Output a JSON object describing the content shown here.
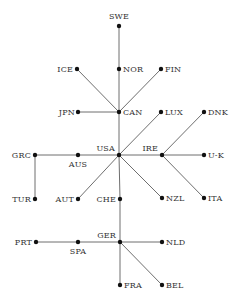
{
  "diagram": {
    "type": "tree",
    "colors": {
      "edge": "#6e6e6e",
      "node": "#111111",
      "label": "#333333",
      "background": "#ffffff"
    },
    "nodes": [
      {
        "id": "SWE",
        "label": "SWE",
        "x": 119,
        "y": 26,
        "lx": 119,
        "ly": 19,
        "anchor": "middle"
      },
      {
        "id": "NOR",
        "label": "NOR",
        "x": 119,
        "y": 69,
        "lx": 123,
        "ly": 72,
        "anchor": "start"
      },
      {
        "id": "ICE",
        "label": "ICE",
        "x": 77,
        "y": 69,
        "lx": 73,
        "ly": 72,
        "anchor": "end"
      },
      {
        "id": "FIN",
        "label": "FIN",
        "x": 161,
        "y": 69,
        "lx": 165,
        "ly": 72,
        "anchor": "start"
      },
      {
        "id": "JPN",
        "label": "JPN",
        "x": 78,
        "y": 112,
        "lx": 75,
        "ly": 115,
        "anchor": "end"
      },
      {
        "id": "CAN",
        "label": "CAN",
        "x": 119,
        "y": 112,
        "lx": 123,
        "ly": 115,
        "anchor": "start"
      },
      {
        "id": "LUX",
        "label": "LUX",
        "x": 161,
        "y": 112,
        "lx": 165,
        "ly": 115,
        "anchor": "start"
      },
      {
        "id": "DNK",
        "label": "DNK",
        "x": 204,
        "y": 112,
        "lx": 208,
        "ly": 115,
        "anchor": "start"
      },
      {
        "id": "GRC",
        "label": "GRC",
        "x": 35,
        "y": 155,
        "lx": 31,
        "ly": 158,
        "anchor": "end"
      },
      {
        "id": "AUS",
        "label": "AUS",
        "x": 78,
        "y": 155,
        "lx": 78,
        "ly": 167,
        "anchor": "middle"
      },
      {
        "id": "USA",
        "label": "USA",
        "x": 119,
        "y": 155,
        "lx": 115,
        "ly": 151,
        "anchor": "end"
      },
      {
        "id": "IRE",
        "label": "IRE",
        "x": 162,
        "y": 155,
        "lx": 158,
        "ly": 151,
        "anchor": "end"
      },
      {
        "id": "U-K",
        "label": "U-K",
        "x": 204,
        "y": 155,
        "lx": 208,
        "ly": 158,
        "anchor": "start"
      },
      {
        "id": "TUR",
        "label": "TUR",
        "x": 35,
        "y": 199,
        "lx": 31,
        "ly": 202,
        "anchor": "end"
      },
      {
        "id": "AUT",
        "label": "AUT",
        "x": 78,
        "y": 199,
        "lx": 74,
        "ly": 202,
        "anchor": "end"
      },
      {
        "id": "CHE",
        "label": "CHE",
        "x": 120,
        "y": 199,
        "lx": 116,
        "ly": 202,
        "anchor": "end"
      },
      {
        "id": "NZL",
        "label": "NZL",
        "x": 162,
        "y": 198,
        "lx": 166,
        "ly": 201,
        "anchor": "start"
      },
      {
        "id": "ITA",
        "label": "ITA",
        "x": 204,
        "y": 198,
        "lx": 208,
        "ly": 201,
        "anchor": "start"
      },
      {
        "id": "PRT",
        "label": "PRT",
        "x": 36,
        "y": 242,
        "lx": 32,
        "ly": 245,
        "anchor": "end"
      },
      {
        "id": "SPA",
        "label": "SPA",
        "x": 78,
        "y": 242,
        "lx": 78,
        "ly": 254,
        "anchor": "middle"
      },
      {
        "id": "GER",
        "label": "GER",
        "x": 120,
        "y": 242,
        "lx": 116,
        "ly": 238,
        "anchor": "end"
      },
      {
        "id": "NLD",
        "label": "NLD",
        "x": 162,
        "y": 242,
        "lx": 166,
        "ly": 245,
        "anchor": "start"
      },
      {
        "id": "FRA",
        "label": "FRA",
        "x": 120,
        "y": 285,
        "lx": 124,
        "ly": 288,
        "anchor": "start"
      },
      {
        "id": "BEL",
        "label": "BEL",
        "x": 162,
        "y": 285,
        "lx": 166,
        "ly": 288,
        "anchor": "start"
      }
    ],
    "edges": [
      [
        "SWE",
        "NOR"
      ],
      [
        "NOR",
        "CAN"
      ],
      [
        "ICE",
        "CAN"
      ],
      [
        "FIN",
        "CAN"
      ],
      [
        "JPN",
        "CAN"
      ],
      [
        "CAN",
        "USA"
      ],
      [
        "LUX",
        "USA"
      ],
      [
        "GRC",
        "AUS"
      ],
      [
        "AUS",
        "USA"
      ],
      [
        "USA",
        "IRE"
      ],
      [
        "DNK",
        "IRE"
      ],
      [
        "IRE",
        "U-K"
      ],
      [
        "IRE",
        "ITA"
      ],
      [
        "GRC",
        "TUR"
      ],
      [
        "AUT",
        "USA"
      ],
      [
        "USA",
        "NZL"
      ],
      [
        "USA",
        "CHE"
      ],
      [
        "CHE",
        "GER"
      ],
      [
        "PRT",
        "SPA"
      ],
      [
        "SPA",
        "GER"
      ],
      [
        "GER",
        "NLD"
      ],
      [
        "GER",
        "FRA"
      ],
      [
        "GER",
        "BEL"
      ]
    ]
  }
}
